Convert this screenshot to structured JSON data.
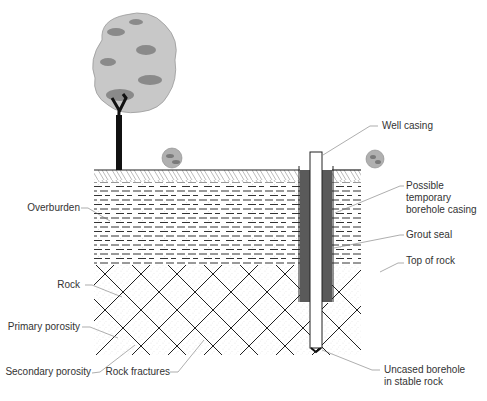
{
  "diagram": {
    "labels": {
      "well_casing": "Well casing",
      "temp_casing_1": "Possible",
      "temp_casing_2": "temporary",
      "temp_casing_3": "borehole casing",
      "grout_seal": "Grout seal",
      "top_of_rock": "Top of rock",
      "overburden": "Overburden",
      "rock": "Rock",
      "primary_porosity": "Primary porosity",
      "secondary_porosity": "Secondary porosity",
      "rock_fractures": "Rock fractures",
      "uncased_1": "Uncased borehole",
      "uncased_2": "in stable rock"
    },
    "colors": {
      "grout": "#5a5a5a",
      "tree_light": "#c8c8c8",
      "tree_dark": "#8a8a8a",
      "trunk": "#111111",
      "lines": "#222222"
    }
  }
}
